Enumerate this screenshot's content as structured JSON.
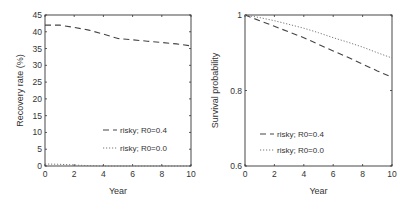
{
  "chart_data": [
    {
      "type": "line",
      "title": "",
      "xlabel": "Year",
      "ylabel": "Recovery rate (%)",
      "xlim": [
        0,
        10
      ],
      "ylim": [
        0,
        45
      ],
      "xticks": [
        0,
        2,
        4,
        6,
        8,
        10
      ],
      "yticks": [
        0,
        5,
        10,
        15,
        20,
        25,
        30,
        35,
        40,
        45
      ],
      "xtick_labels": [
        "0",
        "2",
        "4",
        "6",
        "8",
        "10"
      ],
      "ytick_labels": [
        "0",
        "5",
        "10",
        "15",
        "20",
        "25",
        "30",
        "35",
        "40",
        "45"
      ],
      "grid": false,
      "legend_position": "lower-right",
      "series": [
        {
          "name": "risky; R0=0.4",
          "style": "dashed",
          "x": [
            0,
            1,
            2,
            3,
            4,
            5,
            6,
            7,
            8,
            9,
            10
          ],
          "values": [
            42,
            42,
            41.3,
            40.5,
            39.3,
            38,
            37.6,
            37.2,
            36.8,
            36.4,
            35.8
          ]
        },
        {
          "name": "risky; R0=0.0",
          "style": "dotted",
          "x": [
            0,
            1,
            2,
            3,
            4,
            5,
            6,
            7,
            8,
            9,
            10
          ],
          "values": [
            0.6,
            0.5,
            0.3,
            0.1,
            0,
            0,
            0,
            0,
            0,
            0,
            0
          ]
        }
      ]
    },
    {
      "type": "line",
      "title": "",
      "xlabel": "Year",
      "ylabel": "Survival probability",
      "xlim": [
        0,
        10
      ],
      "ylim": [
        0.6,
        1.0
      ],
      "xticks": [
        0,
        2,
        4,
        6,
        8,
        10
      ],
      "yticks": [
        0.6,
        0.8,
        1.0
      ],
      "xtick_labels": [
        "0",
        "2",
        "4",
        "6",
        "8",
        "10"
      ],
      "ytick_labels": [
        "0.6",
        "0.8",
        "1"
      ],
      "grid": false,
      "legend_position": "lower-left",
      "series": [
        {
          "name": "risky; R0=0.4",
          "style": "dashed",
          "x": [
            0,
            1,
            2,
            3,
            4,
            5,
            6,
            7,
            8,
            9,
            10
          ],
          "values": [
            1.0,
            0.985,
            0.97,
            0.955,
            0.94,
            0.922,
            0.905,
            0.888,
            0.87,
            0.852,
            0.835
          ]
        },
        {
          "name": "risky; R0=0.0",
          "style": "dotted",
          "x": [
            0,
            1,
            2,
            3,
            4,
            5,
            6,
            7,
            8,
            9,
            10
          ],
          "values": [
            1.0,
            0.993,
            0.985,
            0.975,
            0.965,
            0.953,
            0.94,
            0.928,
            0.915,
            0.9,
            0.886
          ]
        }
      ]
    }
  ]
}
